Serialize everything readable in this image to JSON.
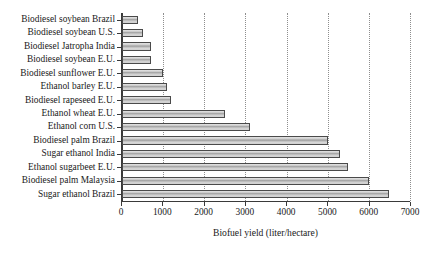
{
  "chart_data": {
    "type": "bar",
    "orientation": "horizontal",
    "title": "",
    "xlabel": "Biofuel yield (liter/hectare)",
    "ylabel": "",
    "xlim": [
      0,
      7000
    ],
    "xticks": [
      0,
      1000,
      2000,
      3000,
      4000,
      5000,
      6000,
      7000
    ],
    "xtick_labels": [
      "0",
      "1000",
      "2000",
      "3000",
      "4000",
      "5000",
      "6000",
      "7000"
    ],
    "grid": "vertical-dotted",
    "legend": "none",
    "categories": [
      "Biodiesel soybean Brazil",
      "Biodiesel soybean U.S.",
      "Biodiesel Jatropha India",
      "Biodiesel soybean E.U.",
      "Biodiesel sunflower E.U.",
      "Ethanol barley E.U.",
      "Biodiesel rapeseed E.U.",
      "Ethanol wheat E.U.",
      "Ethanol corn U.S.",
      "Biodiesel palm Brazil",
      "Sugar ethanol India",
      "Ethanol sugarbeet E.U.",
      "Biodiesel palm Malaysia",
      "Sugar ethanol Brazil"
    ],
    "values": [
      400,
      500,
      700,
      700,
      1000,
      1100,
      1200,
      2500,
      3100,
      5000,
      5300,
      5500,
      6000,
      6500
    ],
    "bar_fill_color": "#c9c9c9",
    "bar_edge_color": "#4a4a4a",
    "axis_color": "#3a3a3a",
    "gridline_color": "#8e8e8e",
    "background_color": "#ffffff"
  }
}
